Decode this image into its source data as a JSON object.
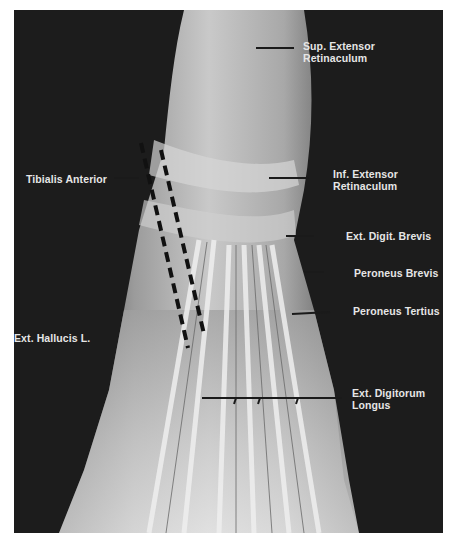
{
  "figure": {
    "labels": [
      {
        "id": "sup-extensor-retinaculum",
        "lines": [
          "Sup. Extensor",
          "Retinaculum"
        ]
      },
      {
        "id": "tibialis-anterior",
        "lines": [
          "Tibialis Anterior"
        ]
      },
      {
        "id": "inf-extensor-retinaculum",
        "lines": [
          "Inf. Extensor",
          "Retinaculum"
        ]
      },
      {
        "id": "ext-digit-brevis",
        "lines": [
          "Ext. Digit. Brevis"
        ]
      },
      {
        "id": "peroneus-brevis",
        "lines": [
          "Peroneus Brevis"
        ]
      },
      {
        "id": "peroneus-tertius",
        "lines": [
          "Peroneus Tertius"
        ]
      },
      {
        "id": "ext-hallucis-l",
        "lines": [
          "Ext. Hallucis L."
        ]
      },
      {
        "id": "ext-digitorum-longus",
        "lines": [
          "Ext. Digitorum",
          "Longus"
        ]
      }
    ],
    "colors": {
      "background": "#1c1c1c",
      "label_text": "#e6e6e6",
      "leader_line": "#1a1a1a",
      "tissue_light": "#d8d8d8",
      "tissue_mid": "#9a9a9a"
    }
  }
}
